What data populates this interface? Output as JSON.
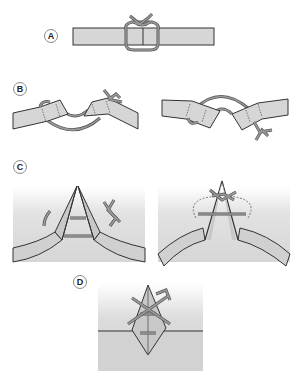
{
  "panels": [
    {
      "id": "A",
      "label": "A"
    },
    {
      "id": "B",
      "label": "B"
    },
    {
      "id": "C",
      "label": "C"
    },
    {
      "id": "D",
      "label": "D"
    }
  ],
  "colors": {
    "tape_fill": "#d6d6d6",
    "tape_stroke": "#333333",
    "suture": "#8a8a8a",
    "suture_stroke": "#555555",
    "skin_gradient_top": "#ffffff",
    "skin_gradient_bottom": "#d8d8d8",
    "label_border": "#888888"
  }
}
